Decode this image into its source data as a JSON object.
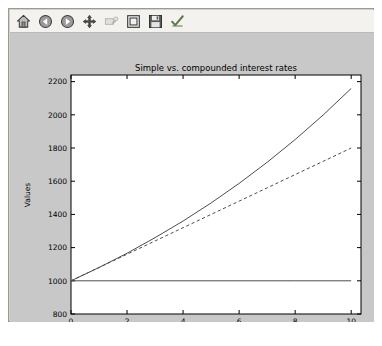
{
  "window": {
    "background_color": "#d4d0c8",
    "border_color": "#9a9a93"
  },
  "toolbar": {
    "background_color": "#f3f2ee",
    "buttons": [
      {
        "name": "home-icon",
        "label": "Home",
        "tooltip": "Reset original view",
        "enabled": true
      },
      {
        "name": "back-arrow-icon",
        "label": "Back",
        "tooltip": "Back to previous view",
        "enabled": true
      },
      {
        "name": "forward-arrow-icon",
        "label": "Forward",
        "tooltip": "Forward to next view",
        "enabled": true
      },
      {
        "name": "pan-move-icon",
        "label": "Pan",
        "tooltip": "Pan axes with left mouse",
        "enabled": true
      },
      {
        "name": "zoom-rect-icon",
        "label": "Zoom",
        "tooltip": "Zoom to rectangle",
        "enabled": false
      },
      {
        "name": "configure-subplots-icon",
        "label": "Subplots",
        "tooltip": "Configure subplots",
        "enabled": true
      },
      {
        "name": "save-floppy-icon",
        "label": "Save",
        "tooltip": "Save the figure",
        "enabled": true
      },
      {
        "name": "checkmark-icon",
        "label": "Check",
        "tooltip": "Toggle option",
        "enabled": true
      }
    ]
  },
  "figure": {
    "background_color": "#c8c8c8",
    "axes_background_color": "#ffffff"
  },
  "chart_data": {
    "type": "line",
    "title": "Simple vs. compounded interest rates",
    "xlabel": "Number of years",
    "ylabel": "Values",
    "xlim": [
      0,
      10.35
    ],
    "ylim": [
      800,
      2240
    ],
    "xticks": [
      0,
      2,
      4,
      6,
      8,
      10
    ],
    "yticks": [
      800,
      1000,
      1200,
      1400,
      1600,
      1800,
      2000,
      2200
    ],
    "xticklabels": [
      "0",
      "2",
      "4",
      "6",
      "8",
      "10"
    ],
    "yticklabels": [
      "800",
      "1000",
      "1200",
      "1400",
      "1600",
      "1800",
      "2000",
      "2200"
    ],
    "grid": false,
    "legend": null,
    "x": [
      0,
      1,
      2,
      3,
      4,
      5,
      6,
      7,
      8,
      9,
      10
    ],
    "series": [
      {
        "name": "Principal",
        "style": "solid",
        "color": "#4d4d4d",
        "values": [
          1000,
          1000,
          1000,
          1000,
          1000,
          1000,
          1000,
          1000,
          1000,
          1000,
          1000
        ]
      },
      {
        "name": "Simple interest",
        "style": "dashed",
        "color": "#4d4d4d",
        "values": [
          1000,
          1080,
          1160,
          1240,
          1320,
          1400,
          1480,
          1560,
          1640,
          1720,
          1800
        ]
      },
      {
        "name": "Compounded interest",
        "style": "solid",
        "color": "#4d4d4d",
        "values": [
          1000,
          1080,
          1166,
          1260,
          1360,
          1469,
          1587,
          1714,
          1851,
          1999,
          2159
        ]
      }
    ]
  }
}
